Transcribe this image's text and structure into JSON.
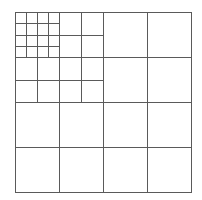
{
  "diagram": {
    "type": "recursive-grid-subdivision",
    "line_color": "#5a5a5a",
    "background": "#ffffff",
    "outer_square": {
      "x": 15,
      "y": 12,
      "width": 176,
      "height": 180
    },
    "levels": [
      {
        "name": "level-0",
        "region": {
          "x": 15,
          "y": 12,
          "w": 176,
          "h": 180
        },
        "cols": 4,
        "rows": 4
      },
      {
        "name": "level-1",
        "region": {
          "x": 15,
          "y": 12,
          "w": 88,
          "h": 90
        },
        "cols": 4,
        "rows": 4
      },
      {
        "name": "level-2",
        "region": {
          "x": 15,
          "y": 12,
          "w": 44,
          "h": 45
        },
        "cols": 4,
        "rows": 4
      }
    ]
  }
}
